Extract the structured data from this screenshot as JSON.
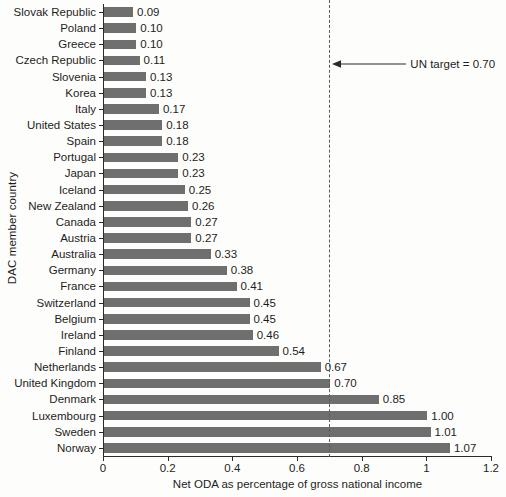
{
  "chart_data": {
    "type": "bar",
    "orientation": "horizontal",
    "title": "",
    "xlabel": "Net ODA as percentage of gross national income",
    "ylabel": "DAC member country",
    "xlim": [
      0,
      1.2
    ],
    "xticks": [
      "0",
      "0.2",
      "0.4",
      "0.6",
      "0.8",
      "1",
      "1.2"
    ],
    "xtick_values": [
      0,
      0.2,
      0.4,
      0.6,
      0.8,
      1.0,
      1.2
    ],
    "grid": false,
    "legend": null,
    "bar_color": "#6f6f6f",
    "categories": [
      "Slovak Republic",
      "Poland",
      "Greece",
      "Czech Republic",
      "Slovenia",
      "Korea",
      "Italy",
      "United States",
      "Spain",
      "Portugal",
      "Japan",
      "Iceland",
      "New Zealand",
      "Canada",
      "Austria",
      "Australia",
      "Germany",
      "France",
      "Switzerland",
      "Belgium",
      "Ireland",
      "Finland",
      "Netherlands",
      "United Kingdom",
      "Denmark",
      "Luxembourg",
      "Sweden",
      "Norway"
    ],
    "values": [
      0.09,
      0.1,
      0.1,
      0.11,
      0.13,
      0.13,
      0.17,
      0.18,
      0.18,
      0.23,
      0.23,
      0.25,
      0.26,
      0.27,
      0.27,
      0.33,
      0.38,
      0.41,
      0.45,
      0.45,
      0.46,
      0.54,
      0.67,
      0.7,
      0.85,
      1.0,
      1.01,
      1.07
    ],
    "data_labels": [
      "0.09",
      "0.10",
      "0.10",
      "0.11",
      "0.13",
      "0.13",
      "0.17",
      "0.18",
      "0.18",
      "0.23",
      "0.23",
      "0.25",
      "0.26",
      "0.27",
      "0.27",
      "0.33",
      "0.38",
      "0.41",
      "0.45",
      "0.45",
      "0.46",
      "0.54",
      "0.67",
      "0.70",
      "0.85",
      "1.00",
      "1.01",
      "1.07"
    ],
    "annotations": [
      {
        "name": "un-target",
        "label": "UN target = 0.70",
        "value": 0.7,
        "line_style": "dashed",
        "arrow": "left"
      }
    ]
  }
}
